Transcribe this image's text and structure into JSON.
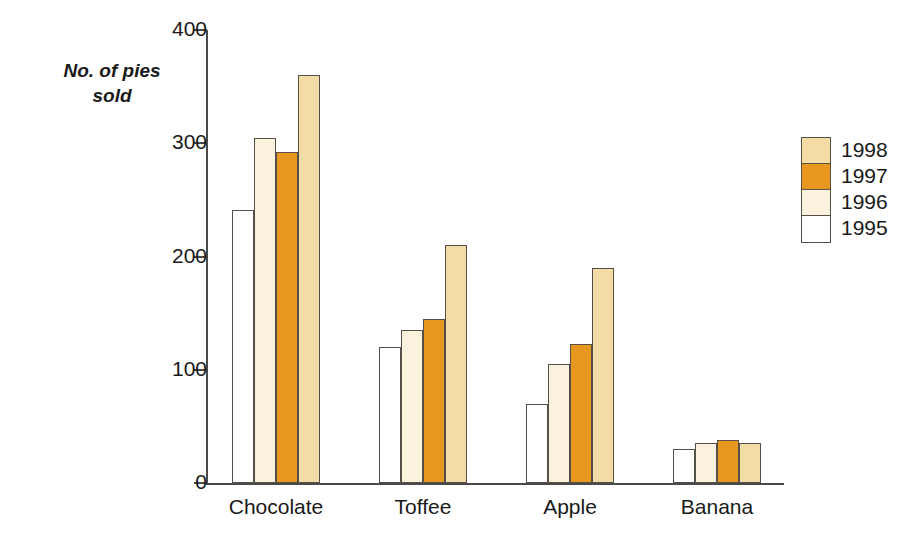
{
  "chart_data": {
    "type": "bar",
    "title": "",
    "xlabel": "",
    "ylabel": "No. of pies\nsold",
    "categories": [
      "Chocolate",
      "Toffee",
      "Apple",
      "Banana"
    ],
    "series": [
      {
        "name": "1995",
        "color": "#FFFFFF",
        "values": [
          241,
          120,
          70,
          30
        ]
      },
      {
        "name": "1996",
        "color": "#FAF2DC",
        "values": [
          305,
          135,
          105,
          35
        ]
      },
      {
        "name": "1997",
        "color": "#E8971F",
        "values": [
          292,
          145,
          123,
          38
        ]
      },
      {
        "name": "1998",
        "color": "#F4DCA7",
        "values": [
          360,
          210,
          190,
          35
        ]
      }
    ],
    "ylim": [
      0,
      400
    ],
    "y_ticks": [
      0,
      100,
      200,
      300,
      400
    ],
    "y_tick_labels": [
      "0",
      "100",
      "200",
      "300",
      "400"
    ],
    "grid": false,
    "legend_position": "right",
    "legend_order": [
      "1998",
      "1997",
      "1996",
      "1995"
    ],
    "bar_border_color": "#555047",
    "axis_color": "#4A4A4A"
  }
}
